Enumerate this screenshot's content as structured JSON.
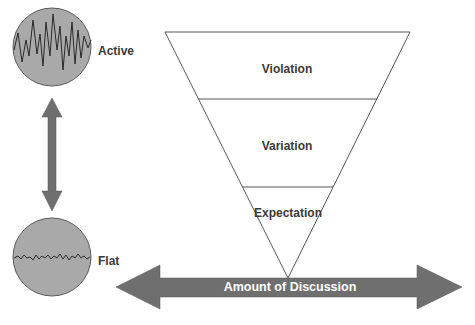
{
  "diagram": {
    "states": {
      "active": {
        "label": "Active",
        "icon": "jagged-wave-icon"
      },
      "flat": {
        "label": "Flat",
        "icon": "flat-wave-icon"
      }
    },
    "vertical_arrow": {
      "icon": "double-arrow-vertical-icon"
    },
    "funnel": {
      "levels": [
        {
          "label": "Violation"
        },
        {
          "label": "Variation"
        },
        {
          "label": "Expectation"
        }
      ]
    },
    "axis": {
      "label": "Amount of Discussion",
      "icon": "double-arrow-horizontal-icon"
    },
    "colors": {
      "circle_fill": "#a9a9a9",
      "circle_stroke": "#5a5a5a",
      "arrow_fill": "#6f6f6f",
      "funnel_stroke": "#555555",
      "text": "#3a3a3a",
      "axis_text": "#ffffff"
    }
  }
}
